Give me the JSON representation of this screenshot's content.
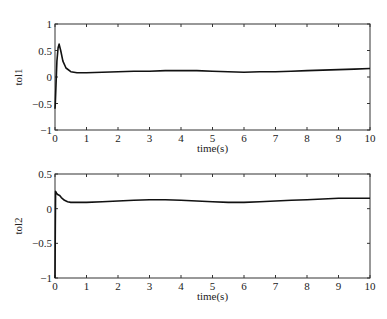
{
  "chart_data": [
    {
      "type": "line",
      "title": "",
      "xlabel": "time(s)",
      "ylabel": "tol1",
      "xlim": [
        0,
        10
      ],
      "ylim": [
        -1,
        1
      ],
      "xticks": [
        "0",
        "1",
        "2",
        "3",
        "4",
        "5",
        "6",
        "7",
        "8",
        "9",
        "10"
      ],
      "yticks": [
        "1",
        "0.5",
        "0",
        "-0.5",
        "-1"
      ],
      "grid": false,
      "legend": null,
      "series": [
        {
          "name": "tol1",
          "color": "#111111",
          "x": [
            0,
            0.01,
            0.03,
            0.06,
            0.1,
            0.13,
            0.18,
            0.25,
            0.35,
            0.5,
            0.7,
            1.0,
            1.5,
            2.0,
            2.5,
            3.0,
            3.5,
            4.0,
            4.5,
            5.0,
            5.5,
            6.0,
            6.5,
            7.0,
            7.5,
            8.0,
            8.5,
            9.0,
            9.5,
            10.0
          ],
          "values": [
            -0.6,
            -0.5,
            -0.2,
            0.3,
            0.55,
            0.62,
            0.5,
            0.3,
            0.17,
            0.1,
            0.08,
            0.08,
            0.09,
            0.1,
            0.11,
            0.11,
            0.12,
            0.12,
            0.12,
            0.11,
            0.1,
            0.09,
            0.1,
            0.1,
            0.11,
            0.12,
            0.13,
            0.14,
            0.15,
            0.16
          ]
        }
      ]
    },
    {
      "type": "line",
      "title": "",
      "xlabel": "time(s)",
      "ylabel": "tol2",
      "xlim": [
        0,
        10
      ],
      "ylim": [
        -1,
        0.5
      ],
      "xticks": [
        "0",
        "1",
        "2",
        "3",
        "4",
        "5",
        "6",
        "7",
        "8",
        "9",
        "10"
      ],
      "yticks": [
        "0.5",
        "0",
        "-0.5",
        "-1"
      ],
      "grid": false,
      "legend": null,
      "series": [
        {
          "name": "tol2",
          "color": "#111111",
          "x": [
            0,
            0.01,
            0.02,
            0.05,
            0.1,
            0.15,
            0.2,
            0.3,
            0.4,
            0.5,
            0.7,
            1.0,
            1.5,
            2.0,
            2.5,
            3.0,
            3.5,
            4.0,
            4.5,
            5.0,
            5.5,
            6.0,
            6.5,
            7.0,
            7.5,
            8.0,
            8.5,
            9.0,
            9.5,
            10.0
          ],
          "values": [
            -1.0,
            -0.3,
            0.25,
            0.22,
            0.2,
            0.19,
            0.16,
            0.12,
            0.1,
            0.09,
            0.09,
            0.09,
            0.1,
            0.11,
            0.12,
            0.13,
            0.13,
            0.12,
            0.11,
            0.1,
            0.09,
            0.09,
            0.1,
            0.11,
            0.12,
            0.13,
            0.14,
            0.15,
            0.15,
            0.15
          ]
        }
      ]
    }
  ]
}
